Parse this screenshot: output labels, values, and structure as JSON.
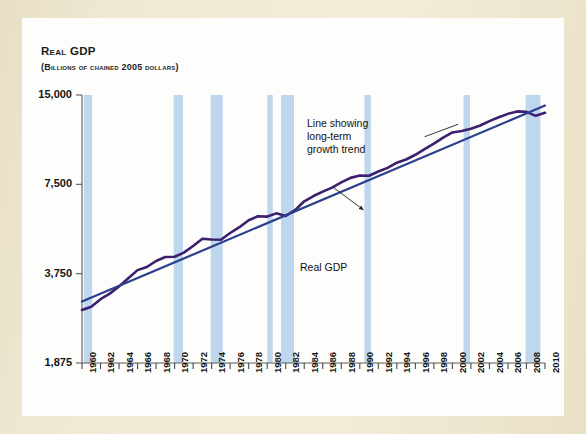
{
  "figure": {
    "mat_color": "#eae2c8",
    "card_color": "#fdfdfb"
  },
  "chart_data": {
    "type": "line",
    "title": "Real GDP",
    "subtitle": "(Billions of chained 2005 dollars)",
    "xlabel": "",
    "ylabel": "Real GDP",
    "yscale": "log",
    "ylim": [
      1875,
      15000
    ],
    "ytick_labels": [
      "15,000",
      "7,500",
      "3,750",
      "1,875"
    ],
    "ytick_values": [
      15000,
      7500,
      3750,
      1875
    ],
    "xlim": [
      1960,
      2010
    ],
    "xtick_labels": [
      "1960",
      "1962",
      "1964",
      "1966",
      "1968",
      "1970",
      "1972",
      "1974",
      "1976",
      "1978",
      "1980",
      "1982",
      "1984",
      "1986",
      "1988",
      "1990",
      "1992",
      "1994",
      "1996",
      "1998",
      "2000",
      "2002",
      "2004",
      "2006",
      "2008",
      "2010"
    ],
    "grid": false,
    "legend": "none",
    "series": [
      {
        "name": "Real GDP",
        "color": "#3c1f6e",
        "x": [
          1960,
          1961,
          1962,
          1963,
          1964,
          1965,
          1966,
          1967,
          1968,
          1969,
          1970,
          1971,
          1972,
          1973,
          1974,
          1975,
          1976,
          1977,
          1978,
          1979,
          1980,
          1981,
          1982,
          1983,
          1984,
          1985,
          1986,
          1987,
          1988,
          1989,
          1990,
          1991,
          1992,
          1993,
          1994,
          1995,
          1996,
          1997,
          1998,
          1999,
          2000,
          2001,
          2002,
          2003,
          2004,
          2005,
          2006,
          2007,
          2008,
          2009,
          2010
        ],
        "values": [
          2830,
          2900,
          3077,
          3212,
          3398,
          3617,
          3854,
          3949,
          4138,
          4269,
          4275,
          4414,
          4648,
          4917,
          4890,
          4880,
          5141,
          5378,
          5677,
          5855,
          5839,
          5987,
          5871,
          6136,
          6577,
          6849,
          7087,
          7313,
          7614,
          7886,
          8034,
          8015,
          8287,
          8523,
          8871,
          9094,
          9434,
          9854,
          10284,
          10780,
          11216,
          11338,
          11543,
          11836,
          12247,
          12623,
          12959,
          13207,
          13162,
          12758,
          13063
        ]
      },
      {
        "name": "Line showing long-term growth trend",
        "color": "#2b3f8c",
        "x": [
          1960,
          2010
        ],
        "values": [
          3020,
          13820
        ]
      }
    ],
    "recession_bands": {
      "color": "#bed7ee",
      "label": "recession",
      "periods": [
        [
          1960.2,
          1961.1
        ],
        [
          1969.9,
          1970.9
        ],
        [
          1973.9,
          1975.2
        ],
        [
          1980.0,
          1980.6
        ],
        [
          1981.5,
          1982.9
        ],
        [
          1990.5,
          1991.2
        ],
        [
          2001.2,
          2001.9
        ],
        [
          2007.9,
          2009.5
        ]
      ]
    },
    "annotations": [
      {
        "name": "trend-line-annotation",
        "text_lines": [
          "Line showing",
          "long-term",
          "growth trend"
        ],
        "leader_from": [
          1997.0,
          10850
        ],
        "leader_to": [
          2000.6,
          11950
        ]
      },
      {
        "name": "real-gdp-annotation",
        "text_lines": [
          "Real GDP"
        ],
        "leader_from": [
          1990.4,
          6150
        ],
        "leader_to": [
          1987.0,
          7380
        ]
      }
    ]
  }
}
